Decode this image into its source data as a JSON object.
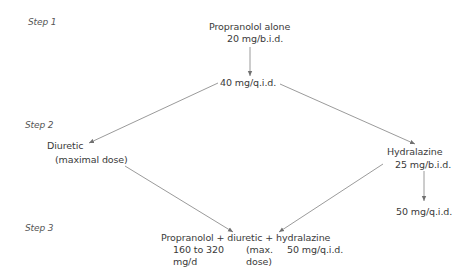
{
  "steps": {
    "step1": "Step 1",
    "step2": "Step 2",
    "step3": "Step 3"
  },
  "nodes": {
    "start": {
      "line1": "Propranolol alone",
      "line2": "20 mg/b.i.d."
    },
    "escalate": {
      "line1": "40 mg/q.i.d."
    },
    "diuretic": {
      "line1": "Diuretic",
      "line2": "(maximal dose)"
    },
    "hydralazine": {
      "line1": "Hydralazine",
      "line2": "25 mg/b.i.d."
    },
    "hydralazine_up": {
      "line1": "50 mg/q.i.d."
    },
    "combo": {
      "line1": "Propranolol + diuretic + hydralazine",
      "propranolol_dose_1": "160 to 320",
      "propranolol_dose_2": "mg/d",
      "diuretic_dose_1": "(max.",
      "diuretic_dose_2": "dose)",
      "hydralazine_dose": "50 mg/q.i.d."
    }
  },
  "colors": {
    "text": "#3a3a3a",
    "line": "#707070"
  }
}
